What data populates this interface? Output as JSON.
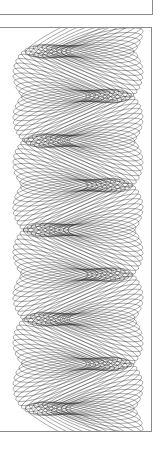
{
  "figure": {
    "stroke_color": "#1a1a1a",
    "frame_color": "#8a8a8a",
    "background": "#ffffff",
    "helix": {
      "turns": 4.5,
      "loops": 180,
      "center_x": 80,
      "amplitude_x": 48,
      "ellipse_rx": 58,
      "ellipse_ry": 9,
      "top": 28,
      "bottom": 430
    }
  }
}
